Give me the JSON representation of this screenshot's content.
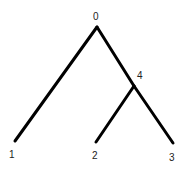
{
  "diagram": {
    "type": "tree",
    "nodes": [
      {
        "id": "0",
        "label": "0",
        "role": "root"
      },
      {
        "id": "4",
        "label": "4",
        "role": "internal"
      },
      {
        "id": "1",
        "label": "1",
        "role": "leaf"
      },
      {
        "id": "2",
        "label": "2",
        "role": "leaf"
      },
      {
        "id": "3",
        "label": "3",
        "role": "leaf"
      }
    ],
    "edges": [
      {
        "from": "0",
        "to": "1"
      },
      {
        "from": "0",
        "to": "4"
      },
      {
        "from": "4",
        "to": "2"
      },
      {
        "from": "4",
        "to": "3"
      }
    ],
    "line_color": "#000000"
  }
}
